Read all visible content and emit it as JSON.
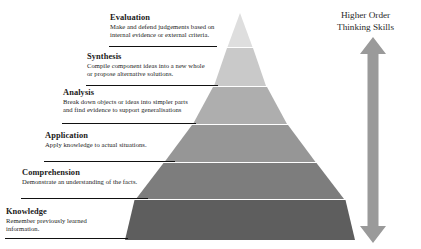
{
  "diagram": {
    "title_right": {
      "line1": "Higher Order",
      "line2": "Thinking Skills"
    },
    "arrow": {
      "name": "double-headed-vertical-arrow",
      "color": "#9a9a9a",
      "direction": "up-down"
    },
    "pyramid": {
      "apex_color": "#e2e2e2",
      "base_color": "#5e5e5e",
      "separator_color": "#ffffff"
    },
    "levels": [
      {
        "title": "Evaluation",
        "description": "Make and defend judgements based on internal evidence or external criteria.",
        "fill": "#dedede"
      },
      {
        "title": "Synthesis",
        "description": "Compile component ideas into a new whole or propose alternative solutions.",
        "fill": "#c9c9c9"
      },
      {
        "title": "Analysis",
        "description": "Break down objects or ideas into simpler parts and find evidence to support generalisations",
        "fill": "#aeaeae"
      },
      {
        "title": "Application",
        "description": "Apply knowledge to actual situations.",
        "fill": "#969696"
      },
      {
        "title": "Comprehension",
        "description": "Demonstrate an understanding of the facts.",
        "fill": "#7d7d7d"
      },
      {
        "title": "Knowledge",
        "description": "Remember previously learned information.",
        "fill": "#5e5e5e"
      }
    ]
  }
}
